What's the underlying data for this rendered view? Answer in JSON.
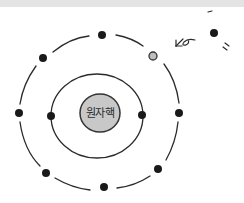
{
  "diagram": {
    "type": "atomic-model",
    "nucleus": {
      "label": "원자핵",
      "fill": "#c8c8c8",
      "stroke": "#333333",
      "cx": 100,
      "cy": 113,
      "r": 20
    },
    "inner_shell": {
      "cx": 97,
      "cy": 116,
      "rx": 46,
      "ry": 42
    },
    "outer_shell": {
      "cx": 100,
      "cy": 111,
      "rx": 80,
      "ry": 76
    },
    "electrons": [
      {
        "x": 102,
        "y": 35,
        "shell": "outer",
        "state": "filled"
      },
      {
        "x": 43,
        "y": 58,
        "shell": "outer",
        "state": "filled"
      },
      {
        "x": 19,
        "y": 113,
        "shell": "outer",
        "state": "filled"
      },
      {
        "x": 46,
        "y": 173,
        "shell": "outer",
        "state": "filled"
      },
      {
        "x": 104,
        "y": 187,
        "shell": "outer",
        "state": "filled"
      },
      {
        "x": 158,
        "y": 169,
        "shell": "outer",
        "state": "filled"
      },
      {
        "x": 179,
        "y": 113,
        "shell": "outer",
        "state": "filled"
      },
      {
        "x": 153,
        "y": 56,
        "shell": "outer",
        "state": "vacant"
      },
      {
        "x": 51,
        "y": 116,
        "shell": "inner",
        "state": "filled"
      },
      {
        "x": 142,
        "y": 115,
        "shell": "inner",
        "state": "filled"
      }
    ],
    "free_electron": {
      "x": 214,
      "y": 33
    },
    "colors": {
      "electron": "#1a1a1a",
      "vacant": "#bdbdbd",
      "line": "#2a2a2a"
    }
  }
}
